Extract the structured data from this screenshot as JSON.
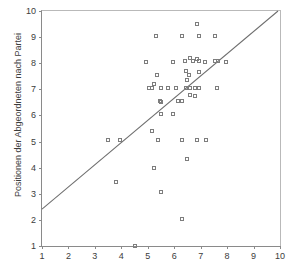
{
  "figure": {
    "title_remnant": "Positionen der Wähler nach Partei",
    "background_color": "#ffffff",
    "marker_color": "#7d7d7d",
    "line_color": "#6e6e6e",
    "axis_color": "#8a8a8a"
  },
  "chart_data": {
    "type": "scatter",
    "title": "",
    "xlabel": "",
    "ylabel": "Positionen der Abgeordneten nach Partei",
    "xlim": [
      1,
      10
    ],
    "ylim": [
      1,
      10
    ],
    "xticks": [
      1,
      2,
      3,
      4,
      5,
      6,
      7,
      8,
      9,
      10
    ],
    "yticks": [
      1,
      2,
      3,
      4,
      5,
      6,
      7,
      8,
      9,
      10
    ],
    "xticklabels": [
      "1",
      "2",
      "3",
      "4",
      "5",
      "6",
      "7",
      "8",
      "9",
      "10"
    ],
    "yticklabels": [
      "1",
      "2",
      "3",
      "4",
      "5",
      "6",
      "7",
      "8",
      "9",
      "10"
    ],
    "grid": false,
    "legend": null,
    "marker": "open-square",
    "reference_line": {
      "type": "line",
      "x": [
        1.0,
        10.0
      ],
      "y": [
        2.35,
        10.0
      ]
    },
    "points": [
      [
        6.85,
        9.5
      ],
      [
        5.3,
        9.05
      ],
      [
        6.3,
        9.05
      ],
      [
        6.95,
        9.05
      ],
      [
        7.55,
        9.05
      ],
      [
        4.95,
        8.05
      ],
      [
        5.95,
        8.05
      ],
      [
        6.4,
        8.1
      ],
      [
        6.6,
        8.2
      ],
      [
        6.7,
        8.1
      ],
      [
        6.85,
        8.15
      ],
      [
        6.95,
        8.1
      ],
      [
        7.15,
        8.05
      ],
      [
        7.55,
        8.1
      ],
      [
        7.65,
        8.1
      ],
      [
        7.95,
        8.05
      ],
      [
        5.35,
        7.55
      ],
      [
        6.45,
        7.7
      ],
      [
        6.55,
        7.55
      ],
      [
        6.5,
        7.35
      ],
      [
        6.95,
        7.65
      ],
      [
        5.25,
        7.2
      ],
      [
        5.05,
        7.05
      ],
      [
        5.15,
        7.05
      ],
      [
        5.5,
        7.05
      ],
      [
        5.75,
        7.05
      ],
      [
        6.05,
        7.05
      ],
      [
        6.45,
        7.05
      ],
      [
        6.6,
        7.05
      ],
      [
        6.8,
        7.05
      ],
      [
        6.95,
        7.05
      ],
      [
        7.6,
        7.05
      ],
      [
        6.6,
        6.8
      ],
      [
        6.8,
        6.75
      ],
      [
        5.45,
        6.55
      ],
      [
        5.5,
        6.5
      ],
      [
        6.15,
        6.55
      ],
      [
        6.3,
        6.55
      ],
      [
        5.5,
        6.05
      ],
      [
        5.95,
        6.05
      ],
      [
        5.15,
        5.4
      ],
      [
        3.5,
        5.05
      ],
      [
        3.95,
        5.05
      ],
      [
        5.4,
        5.05
      ],
      [
        6.3,
        5.05
      ],
      [
        6.85,
        5.05
      ],
      [
        7.2,
        5.05
      ],
      [
        6.5,
        4.35
      ],
      [
        5.25,
        4.0
      ],
      [
        3.8,
        3.45
      ],
      [
        5.5,
        3.05
      ],
      [
        6.3,
        2.05
      ],
      [
        4.5,
        1.0
      ]
    ]
  }
}
